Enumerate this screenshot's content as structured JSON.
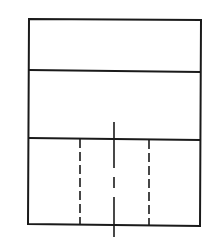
{
  "diagram": {
    "type": "orthographic-view",
    "stroke_color": "#1a1a1a",
    "background": "#ffffff",
    "outline": {
      "x1": 29,
      "y1": 19,
      "x2": 200,
      "y2": 225
    },
    "dividers": [
      {
        "y": 70
      },
      {
        "y": 138
      }
    ],
    "hidden_lines": [
      {
        "x": 80,
        "y1": 138,
        "y2": 224
      },
      {
        "x": 149,
        "y1": 139,
        "y2": 225
      }
    ],
    "centerline": {
      "x": 114,
      "y1": 122,
      "y2": 237
    }
  }
}
